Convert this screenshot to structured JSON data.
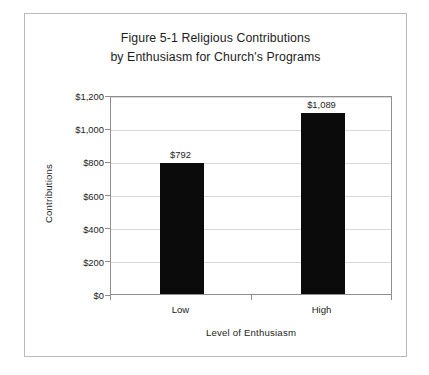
{
  "chart_data": {
    "type": "bar",
    "title": "Figure 5-1 Religious Contributions by Enthusiasm for Church's Programs",
    "title_lines": [
      "Figure 5-1 Religious Contributions",
      "by Enthusiasm for Church's Programs"
    ],
    "categories": [
      "Low",
      "High"
    ],
    "values": [
      792,
      1089
    ],
    "data_labels": [
      "$792",
      "$1,089"
    ],
    "xlabel": "Level of Enthusiasm",
    "ylabel": "Contributions",
    "ylim": [
      0,
      1200
    ],
    "ytick_values": [
      0,
      200,
      400,
      600,
      800,
      1000,
      1200
    ],
    "ytick_labels": [
      "$0",
      "$200",
      "$400",
      "$600",
      "$800",
      "$1,000",
      "$1,200"
    ],
    "grid": true,
    "legend": null,
    "bar_color": "#0b0b0b",
    "gridline_color": "#d9d9d9",
    "axis_color": "#8e8e8e",
    "frame_color": "#b9b9b9",
    "background_color": "#ffffff"
  }
}
